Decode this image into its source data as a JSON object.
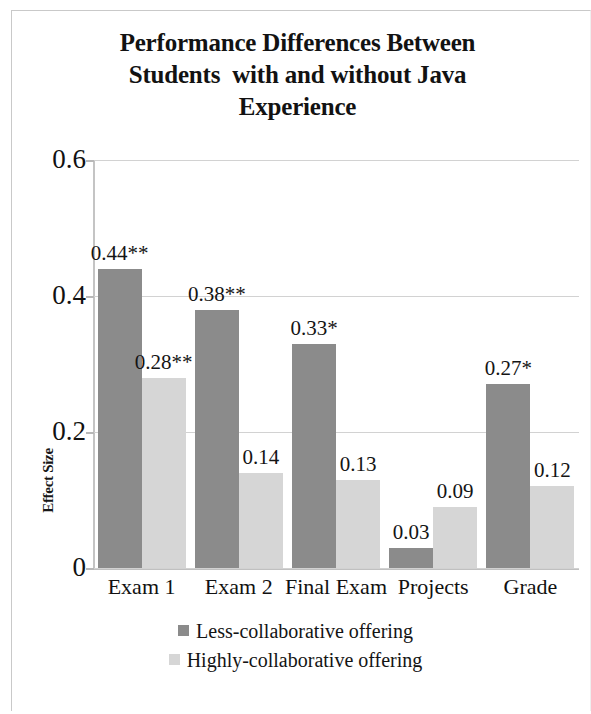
{
  "chart_data": {
    "type": "bar",
    "title": "Performance Differences Between\nStudents  with and without Java\nExperience",
    "xlabel": "",
    "ylabel": "Effect Size",
    "categories": [
      "Exam 1",
      "Exam 2",
      "Final Exam",
      "Projects",
      "Grade"
    ],
    "ylim": [
      0,
      0.6
    ],
    "yticks": [
      "0",
      "0.2",
      "0.4",
      "0.6"
    ],
    "ytick_values": [
      0,
      0.2,
      0.4,
      0.6
    ],
    "grid": true,
    "legend_position": "bottom",
    "series": [
      {
        "name": "Less-collaborative offering",
        "color": "#8b8b8b",
        "values": [
          0.44,
          0.38,
          0.33,
          0.03,
          0.27
        ],
        "labels": [
          "0.44**",
          "0.38**",
          "0.33*",
          "0.03",
          "0.27*"
        ]
      },
      {
        "name": "Highly-collaborative offering",
        "color": "#d6d6d6",
        "values": [
          0.28,
          0.14,
          0.13,
          0.09,
          0.12
        ],
        "labels": [
          "0.28**",
          "0.14",
          "0.13",
          "0.09",
          "0.12"
        ]
      }
    ]
  },
  "legend": {
    "items": [
      {
        "label": "Less-collaborative offering",
        "swatch": "dark"
      },
      {
        "label": "Highly-collaborative offering",
        "swatch": "light"
      }
    ]
  }
}
